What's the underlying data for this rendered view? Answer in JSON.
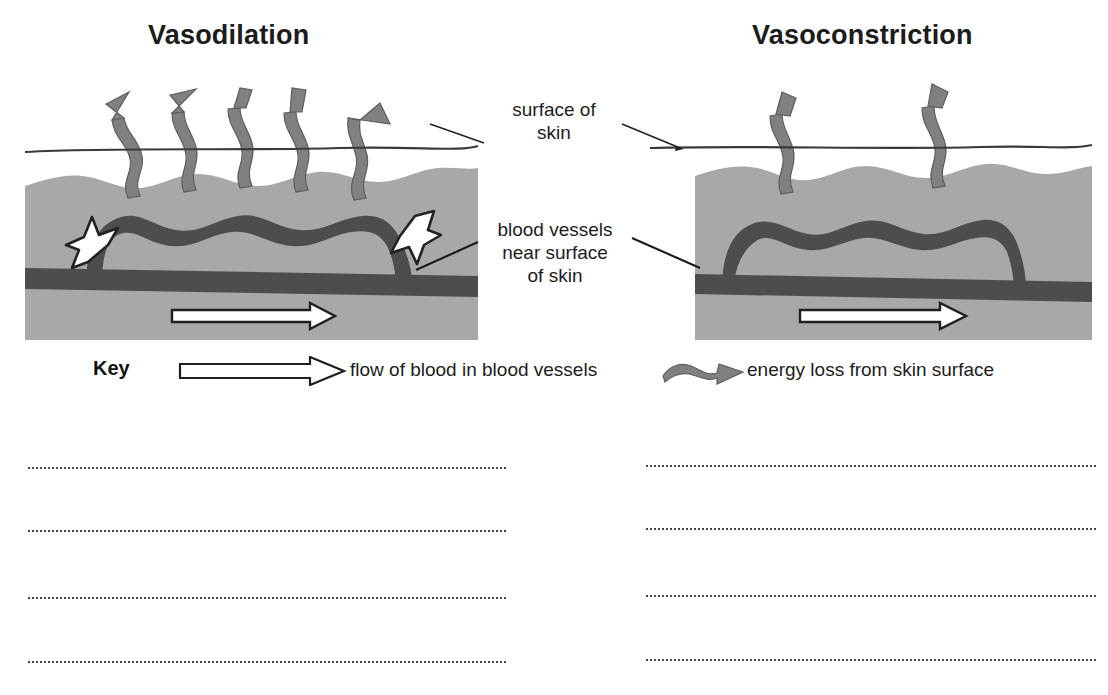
{
  "diagram": {
    "type": "biology-diagram",
    "topic": "Thermoregulation: vasodilation vs vasoconstriction",
    "panels": [
      {
        "id": "vasodilation",
        "title": "Vasodilation",
        "energy_arrow_count": 5,
        "vessel_state": "dilated (wide)",
        "white_arrows": [
          "up-arrow-left",
          "down-arrow-right"
        ],
        "blood_flow_arrow": "right"
      },
      {
        "id": "vasoconstriction",
        "title": "Vasoconstriction",
        "energy_arrow_count": 2,
        "vessel_state": "constricted (narrow)",
        "white_arrows": [],
        "blood_flow_arrow": "right"
      }
    ]
  },
  "labels": {
    "surface_of_skin": "surface of\nskin",
    "surface_of_skin_line1": "surface of",
    "surface_of_skin_line2": "skin",
    "blood_vessels_line1": "blood vessels",
    "blood_vessels_line2": "near surface",
    "blood_vessels_line3": "of skin"
  },
  "key": {
    "heading": "Key",
    "items": [
      {
        "icon": "hollow-right-arrow-icon",
        "text": "flow of blood in blood vessels"
      },
      {
        "icon": "wavy-energy-arrow-icon",
        "text": "energy loss from skin surface"
      }
    ],
    "flow_label": "flow of blood in blood vessels",
    "energy_label": "energy loss from skin surface"
  },
  "answer_lines": {
    "left_count": 4,
    "right_count": 4
  },
  "colors": {
    "skin_fill": "#a8a8a8",
    "vessel_fill": "#4d4d4d",
    "energy_arrow_fill": "#808080",
    "outline": "#2b2b2b",
    "text": "#1c1c1c",
    "white_arrow_fill": "#ffffff",
    "page_background": "#ffffff",
    "dotted_line": "#444444"
  }
}
